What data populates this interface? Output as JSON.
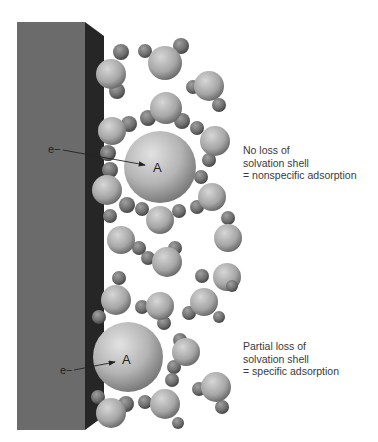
{
  "figure": {
    "electrode": {
      "label": "electrode",
      "front_color": "#6b6b6b",
      "side_color": "#262626"
    },
    "adsorbates": [
      {
        "label": "A",
        "electron_label": "e−",
        "mode": "nonspecific"
      },
      {
        "label": "A",
        "electron_label": "e−",
        "mode": "specific"
      }
    ],
    "annotations": [
      {
        "lines": [
          "No loss of",
          "solvation shell",
          "= nonspecific adsorption"
        ]
      },
      {
        "lines": [
          "Partial loss of",
          "solvation shell",
          "= specific adsorption"
        ]
      }
    ]
  }
}
